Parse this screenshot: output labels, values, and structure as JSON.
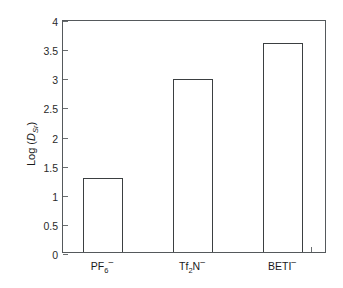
{
  "chart_data": {
    "type": "bar",
    "title": "",
    "subtitle": "",
    "xlabel": "",
    "ylabel": "Log (DSr)",
    "ylabel_parts": {
      "prefix": "Log (",
      "variable": "D",
      "subscript": "Sr",
      "suffix": ")"
    },
    "categories": [
      "PF6-",
      "Tf2N-",
      "BETI-"
    ],
    "category_labels": [
      {
        "base": "PF",
        "sub": "6",
        "sup": "–"
      },
      {
        "base": "Tf",
        "sub": "2",
        "mid": "N",
        "sup": "–"
      },
      {
        "base": "BETI",
        "sub": "",
        "sup": "–"
      }
    ],
    "values": [
      1.27,
      2.97,
      3.58
    ],
    "ylim": [
      0,
      4
    ],
    "ytick_values": [
      0,
      0.5,
      1,
      1.5,
      2,
      2.5,
      3,
      3.5,
      4
    ],
    "ytick_labels": [
      "0",
      "0.5",
      "1",
      "1.5",
      "2",
      "2.5",
      "3",
      "3.5",
      "4"
    ],
    "grid": false,
    "legend": false,
    "legend_position": "none",
    "bar_fill_color": "#ffffff",
    "bar_edge_color": "#3b3f41",
    "axis_color": "#55595c",
    "background_color": "#ffffff"
  }
}
